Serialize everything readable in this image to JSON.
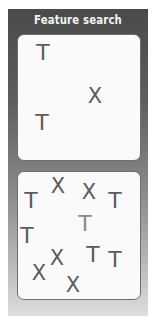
{
  "title": "Feature search",
  "colors": {
    "frame_top": "#4a4a4a",
    "frame_bottom": "#dedede",
    "panel_bg": "#fafafa",
    "glyph": "#5c5c5c",
    "glyph_faint": "#8a8a8a",
    "title_text": "#f4f4f4"
  },
  "panels": [
    {
      "name": "top-panel",
      "items": [
        {
          "char": "T",
          "x": 43,
          "y": 53,
          "color": "#5c5c5c"
        },
        {
          "char": "X",
          "x": 95,
          "y": 96,
          "color": "#5c5c5c"
        },
        {
          "char": "T",
          "x": 42,
          "y": 123,
          "color": "#5c5c5c"
        }
      ]
    },
    {
      "name": "bottom-panel",
      "items": [
        {
          "char": "T",
          "x": 31,
          "y": 201,
          "color": "#5c5c5c"
        },
        {
          "char": "X",
          "x": 58,
          "y": 186,
          "color": "#5c5c5c"
        },
        {
          "char": "X",
          "x": 89,
          "y": 192,
          "color": "#5c5c5c"
        },
        {
          "char": "T",
          "x": 115,
          "y": 201,
          "color": "#5c5c5c"
        },
        {
          "char": "T",
          "x": 85,
          "y": 224,
          "color": "#8a8a8a"
        },
        {
          "char": "T",
          "x": 27,
          "y": 236,
          "color": "#5c5c5c"
        },
        {
          "char": "X",
          "x": 57,
          "y": 258,
          "color": "#5c5c5c"
        },
        {
          "char": "T",
          "x": 93,
          "y": 255,
          "color": "#5c5c5c"
        },
        {
          "char": "T",
          "x": 115,
          "y": 260,
          "color": "#5c5c5c"
        },
        {
          "char": "X",
          "x": 39,
          "y": 273,
          "color": "#5c5c5c"
        },
        {
          "char": "X",
          "x": 73,
          "y": 285,
          "color": "#5c5c5c"
        }
      ]
    }
  ]
}
